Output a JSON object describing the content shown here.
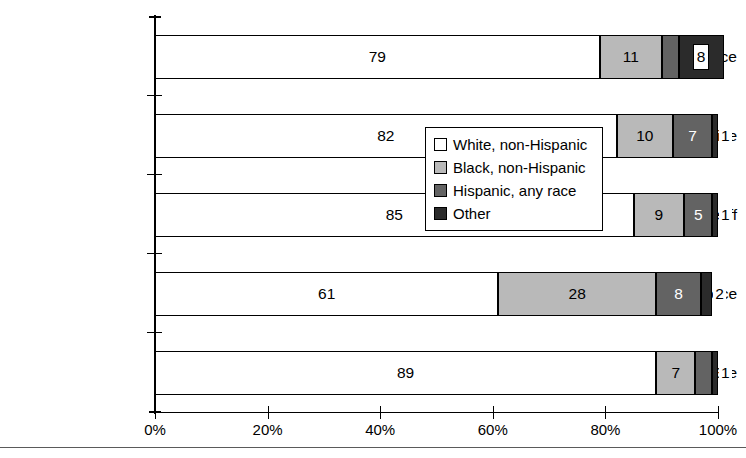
{
  "chart_data": {
    "type": "bar",
    "orientation": "horizontal",
    "stacked": true,
    "stack_mode": "percent",
    "title": "",
    "subtitle": "",
    "xlabel": "",
    "ylabel": "",
    "xlim": [
      0,
      100
    ],
    "grid": false,
    "legend_position": "center",
    "categories": [
      "County Police",
      "Municipal Police",
      "Sheriff",
      "Special Police",
      "State Police"
    ],
    "xticks": [
      "0%",
      "20%",
      "40%",
      "60%",
      "80%",
      "100%"
    ],
    "xtick_values": [
      0,
      20,
      40,
      60,
      80,
      100
    ],
    "series": [
      {
        "name": "White, non-Hispanic",
        "color": "#ffffff",
        "values": [
          79,
          82,
          85,
          61,
          89
        ]
      },
      {
        "name": "Black, non-Hispanic",
        "color": "#b9b9b9",
        "values": [
          11,
          10,
          9,
          28,
          7
        ]
      },
      {
        "name": "Hispanic, any race",
        "color": "#636363",
        "values": [
          3,
          7,
          5,
          8,
          3
        ]
      },
      {
        "name": "Other",
        "color": "#2b2b2b",
        "values": [
          8,
          1,
          1,
          2,
          1
        ]
      }
    ]
  },
  "legend": {
    "items": [
      {
        "label": "White, non-Hispanic",
        "swatch": "sw-white"
      },
      {
        "label": "Black, non-Hispanic",
        "swatch": "sw-lgray"
      },
      {
        "label": "Hispanic, any race",
        "swatch": "sw-dgray"
      },
      {
        "label": "Other",
        "swatch": "sw-black"
      }
    ]
  }
}
